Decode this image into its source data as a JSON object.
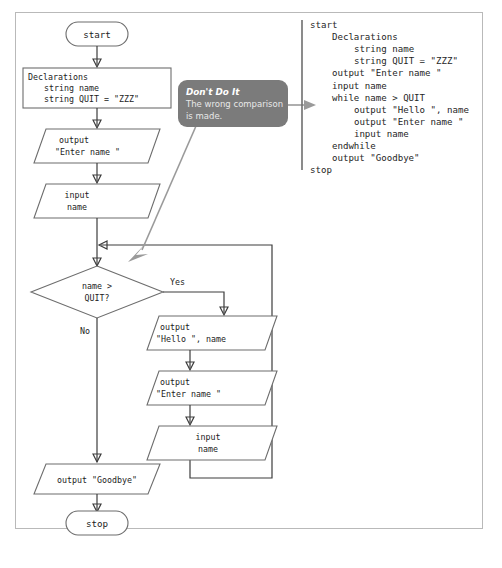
{
  "figure": {
    "frame_color": "#b9b9b9",
    "shape_stroke": "#6d6d6d",
    "line_color": "#3c3c3c",
    "callout_color": "#7b7b7b",
    "callout_arrow_color": "#9a9a9a"
  },
  "flowchart": {
    "start_terminator": "start",
    "stop_terminator": "stop",
    "declarations": {
      "heading": "Declarations",
      "line1": "string name",
      "line2": "string QUIT = \"ZZZ\""
    },
    "output_prompt_1": {
      "line1": "output",
      "line2": "\"Enter name \""
    },
    "input_1": {
      "line1": "input",
      "line2": "name"
    },
    "decision": {
      "line1": "name >",
      "line2": "QUIT?",
      "yes_label": "Yes",
      "no_label": "No"
    },
    "output_hello": {
      "line1": "output",
      "line2": "\"Hello \", name"
    },
    "output_prompt_2": {
      "line1": "output",
      "line2": "\"Enter name \""
    },
    "input_2": {
      "line1": "input",
      "line2": "name"
    },
    "output_goodbye": {
      "line1": "output \"Goodbye\""
    }
  },
  "callout": {
    "title": "Don't Do It",
    "body_line1": "The wrong comparison",
    "body_line2": "is made."
  },
  "pseudocode": {
    "lines": [
      "start",
      "    Declarations",
      "        string name",
      "        string QUIT = \"ZZZ\"",
      "    output \"Enter name \"",
      "    input name",
      "    while name > QUIT",
      "        output \"Hello \", name",
      "        output \"Enter name \"",
      "        input name",
      "    endwhile",
      "    output \"Goodbye\"",
      "stop"
    ]
  }
}
